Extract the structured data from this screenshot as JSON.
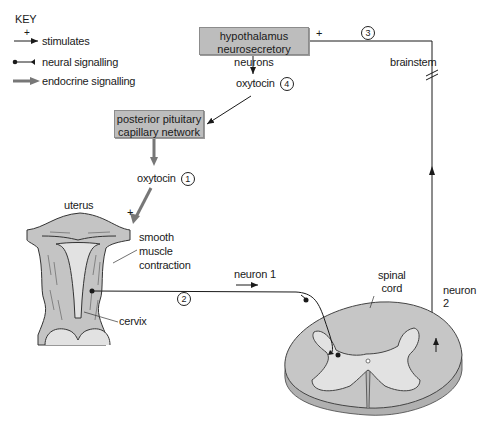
{
  "key": {
    "title": "KEY",
    "items": [
      {
        "symbol": "plus-arrow",
        "label": "stimulates",
        "plus": "+"
      },
      {
        "symbol": "dot-line",
        "label": "neural signalling"
      },
      {
        "symbol": "thick-arrow",
        "label": "endocrine signalling"
      }
    ]
  },
  "boxes": {
    "hypothalamus": {
      "line1": "hypothalamus",
      "line2": "neurosecretory neurons"
    },
    "pituitary": {
      "line1": "posterior pituitary",
      "line2": "capillary network"
    }
  },
  "labels": {
    "oxytocin_4": "oxytocin",
    "step4": "4",
    "oxytocin_1": "oxytocin",
    "step1": "1",
    "step2": "2",
    "step3": "3",
    "plus_hypothalamus": "+",
    "plus_uterus": "+",
    "brainstem": "brainstem",
    "uterus": "uterus",
    "smooth_muscle": [
      "smooth",
      "muscle",
      "contraction"
    ],
    "cervix": "cervix",
    "neuron1": "neuron 1",
    "spinal_cord": [
      "spinal",
      "cord"
    ],
    "neuron2": [
      "neuron",
      "2"
    ]
  },
  "colors": {
    "box_fill": "#bdbdbd",
    "tissue_fill": "#c4c4c4",
    "tissue_light": "#e2e2e2",
    "endocrine_arrow": "#7a7a7a",
    "line": "#1a1a1a"
  }
}
